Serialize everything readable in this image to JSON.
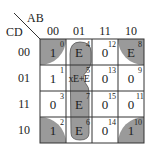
{
  "kmap": {
    "row_var": "CD",
    "col_var": "AB",
    "columns": [
      "00",
      "01",
      "11",
      "10"
    ],
    "rows": [
      "00",
      "01",
      "11",
      "10"
    ],
    "cells": [
      [
        {
          "index": "0",
          "value": "1"
        },
        {
          "index": "4",
          "value": "E"
        },
        {
          "index": "12",
          "value": "0"
        },
        {
          "index": "8",
          "value": "E"
        }
      ],
      [
        {
          "index": "1",
          "value": "1"
        },
        {
          "index": "5",
          "value": "xE+E"
        },
        {
          "index": "13",
          "value": "0"
        },
        {
          "index": "9",
          "value": "0"
        }
      ],
      [
        {
          "index": "3",
          "value": "0"
        },
        {
          "index": "7",
          "value": "E"
        },
        {
          "index": "15",
          "value": "0"
        },
        {
          "index": "11",
          "value": "0"
        }
      ],
      [
        {
          "index": "2",
          "value": "1"
        },
        {
          "index": "6",
          "value": "E"
        },
        {
          "index": "14",
          "value": "0"
        },
        {
          "index": "10",
          "value": "1"
        }
      ]
    ],
    "groups": [
      {
        "name": "corners",
        "cells": [
          "0",
          "8",
          "2",
          "10"
        ]
      },
      {
        "name": "column-01",
        "cells": [
          "4",
          "5",
          "7",
          "6"
        ]
      }
    ],
    "colors": {
      "fill": "#9a9a9a",
      "grid": "#333333",
      "text": "#222222"
    }
  }
}
